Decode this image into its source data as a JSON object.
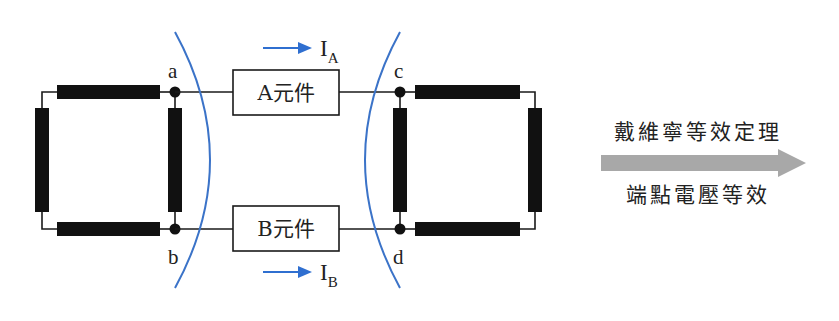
{
  "diagram": {
    "nodes": {
      "a": "a",
      "b": "b",
      "c": "c",
      "d": "d"
    },
    "components": {
      "A": "A元件",
      "B": "B元件"
    },
    "currents": {
      "IA": {
        "main": "I",
        "sub": "A"
      },
      "IB": {
        "main": "I",
        "sub": "B"
      }
    },
    "right_panel": {
      "top_text": "戴維寧等效定理",
      "bottom_text": "端點電壓等效"
    },
    "colors": {
      "wire": "#1a1a1a",
      "resistor": "#111111",
      "boundary_arc": "#3b73c8",
      "current_arrow": "#2f6fd0",
      "big_arrow": "#a8a8a8"
    }
  }
}
